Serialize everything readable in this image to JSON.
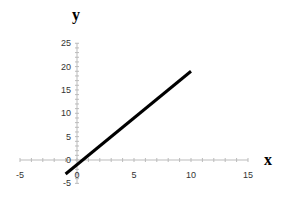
{
  "chart_data": {
    "type": "line",
    "title": "",
    "xlabel": "x",
    "ylabel": "y",
    "xlim": [
      -5,
      15
    ],
    "ylim": [
      -5,
      25
    ],
    "x_ticks": [
      -5,
      0,
      5,
      10,
      15
    ],
    "y_ticks": [
      -5,
      0,
      5,
      10,
      15,
      20,
      25
    ],
    "grid": false,
    "legend": null,
    "series": [
      {
        "name": "y = 2x - 1",
        "x": [
          -1,
          10
        ],
        "values": [
          -3,
          19
        ],
        "color": "#000000"
      }
    ]
  },
  "layout": {
    "origin_px": [
      77,
      160
    ],
    "px_per_x_unit": 11.4,
    "px_per_y_unit": 4.67,
    "axis_color": "#bbbbbb",
    "line_color": "#000000"
  }
}
